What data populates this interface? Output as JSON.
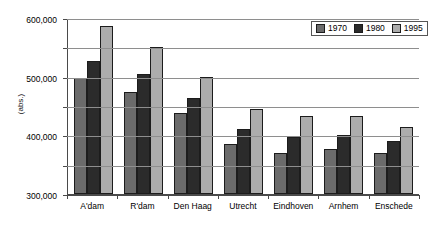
{
  "chart_data": {
    "type": "bar",
    "title": "",
    "subtitle": "",
    "xlabel": "",
    "ylabel": "(abs.)",
    "ylim": [
      0,
      600000
    ],
    "ytick_values": [
      0,
      100000,
      200000,
      300000,
      400000,
      500000,
      600000
    ],
    "ytick_labels": [
      "0",
      "100,000",
      "200,000",
      "300,000",
      "400,000",
      "500,000",
      "600,000"
    ],
    "grid": true,
    "legend_position": "top-right",
    "categories": [
      "A'dam",
      "R'dam",
      "Den Haag",
      "Utrecht",
      "Eindhoven",
      "Arnhem",
      "Enschede"
    ],
    "series": [
      {
        "name": "1970",
        "color": "#6b6b6b",
        "values": [
          395000,
          347000,
          277000,
          169000,
          140000,
          154000,
          141000
        ]
      },
      {
        "name": "1980",
        "color": "#2b2b2b",
        "values": [
          453000,
          408000,
          327000,
          220000,
          194000,
          200000,
          180000
        ]
      },
      {
        "name": "1995",
        "color": "#acacac",
        "values": [
          573000,
          502000,
          399000,
          290000,
          266000,
          265000,
          227000
        ]
      }
    ]
  },
  "legend": {
    "items": [
      {
        "label": "1970"
      },
      {
        "label": "1980"
      },
      {
        "label": "1995"
      }
    ]
  }
}
